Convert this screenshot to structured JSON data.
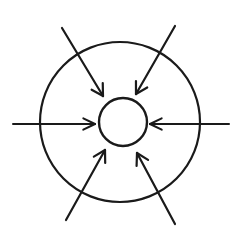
{
  "figure": {
    "background_color": "#ffffff",
    "stroke_color": "#1a1a1a",
    "canvas": {
      "width": 244,
      "height": 237
    }
  },
  "shapes": {
    "outer_circle": {
      "name": "outer-circle",
      "cx": 120,
      "cy": 122,
      "r": 80,
      "stroke_width": 2.2,
      "stroke_color": "#1a1a1a"
    },
    "inner_circle": {
      "name": "inner-circle",
      "cx": 123,
      "cy": 122,
      "r": 24,
      "stroke_width": 2.4,
      "stroke_color": "#1a1a1a"
    }
  },
  "arrows": [
    {
      "name": "arrow-top-left",
      "direction": "down-right",
      "label": "inward from upper left",
      "x1": 62,
      "y1": 28,
      "x2": 103,
      "y2": 96,
      "head_size": 13,
      "head_angle": 30,
      "stroke_width": 2.2
    },
    {
      "name": "arrow-top-right",
      "direction": "down-left",
      "label": "inward from upper right",
      "x1": 175,
      "y1": 26,
      "x2": 136,
      "y2": 94,
      "head_size": 13,
      "head_angle": 30,
      "stroke_width": 2.2
    },
    {
      "name": "arrow-left",
      "direction": "right",
      "label": "inward from left",
      "x1": 13,
      "y1": 124,
      "x2": 95,
      "y2": 124,
      "head_size": 13,
      "head_angle": 26,
      "stroke_width": 2.0
    },
    {
      "name": "arrow-right",
      "direction": "left",
      "label": "inward from right",
      "x1": 229,
      "y1": 124,
      "x2": 150,
      "y2": 124,
      "head_size": 13,
      "head_angle": 26,
      "stroke_width": 2.0
    },
    {
      "name": "arrow-bottom-left",
      "direction": "up-right",
      "label": "inward from lower left",
      "x1": 66,
      "y1": 220,
      "x2": 105,
      "y2": 150,
      "head_size": 13,
      "head_angle": 30,
      "stroke_width": 2.2
    },
    {
      "name": "arrow-bottom-right",
      "direction": "up-left",
      "label": "inward from lower right",
      "x1": 175,
      "y1": 224,
      "x2": 137,
      "y2": 153,
      "head_size": 13,
      "head_angle": 30,
      "stroke_width": 2.2
    }
  ]
}
